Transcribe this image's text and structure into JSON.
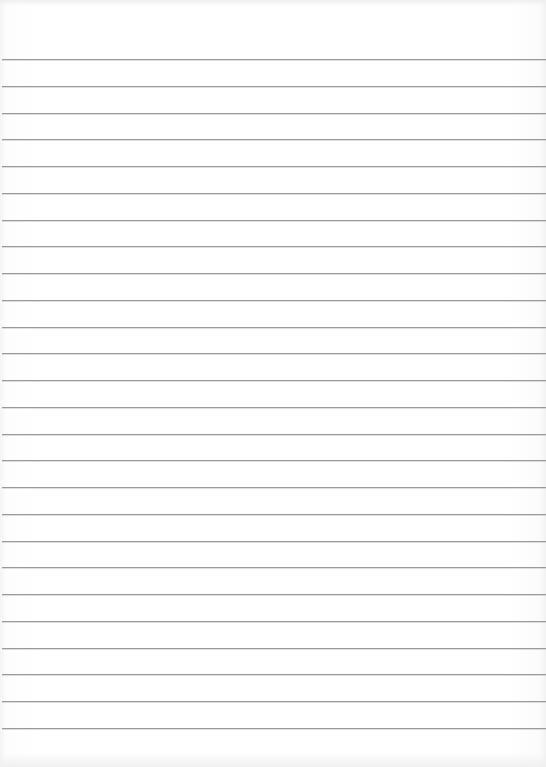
{
  "page": {
    "type": "lined-paper",
    "background": "#ffffff",
    "rule_color": "#9a9a9a",
    "rule_count": 26,
    "first_rule_y": 59,
    "rule_spacing": 26.76
  }
}
